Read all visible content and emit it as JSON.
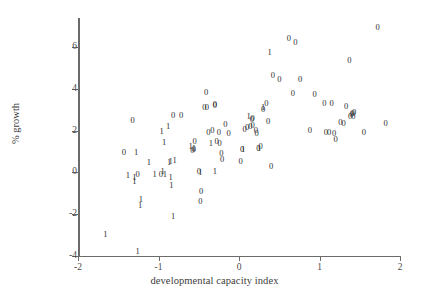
{
  "chart_data": {
    "type": "scatter",
    "title": "",
    "xlabel": "developmental capacity index",
    "ylabel": "% growth",
    "xlim": [
      -2,
      2
    ],
    "ylim": [
      -4,
      7.4
    ],
    "xticks": [
      "-2",
      "-1",
      "0",
      "1",
      "2"
    ],
    "xtick_values": [
      -2,
      -1,
      0,
      1,
      2
    ],
    "yticks": [
      "6",
      "4",
      "2",
      "0",
      "-2",
      "-4"
    ],
    "ytick_values": [
      6,
      4,
      2,
      0,
      -2,
      -4
    ],
    "grid": false,
    "legend": "none",
    "marker_style": "text-glyph",
    "series": [
      {
        "name": "0",
        "marker_label": "0",
        "points": [
          [
            -1.32,
            2.52
          ],
          [
            -1.43,
            0.95
          ],
          [
            -1.26,
            -0.07
          ],
          [
            -0.97,
            -0.1
          ],
          [
            -0.82,
            2.73
          ],
          [
            -0.72,
            2.73
          ],
          [
            -0.58,
            1.05
          ],
          [
            -0.56,
            1.12
          ],
          [
            -0.55,
            1.48
          ],
          [
            -0.5,
            0.05
          ],
          [
            -0.47,
            -0.88
          ],
          [
            -0.48,
            -1.38
          ],
          [
            -0.41,
            3.85
          ],
          [
            -0.43,
            3.12
          ],
          [
            -0.4,
            3.12
          ],
          [
            -0.38,
            1.92
          ],
          [
            -0.33,
            2.02
          ],
          [
            -0.3,
            3.22
          ],
          [
            -0.3,
            3.28
          ],
          [
            -0.28,
            1.52
          ],
          [
            -0.25,
            1.92
          ],
          [
            -0.24,
            1.42
          ],
          [
            -0.22,
            0.92
          ],
          [
            -0.21,
            0.62
          ],
          [
            -0.17,
            2.32
          ],
          [
            -0.13,
            1.88
          ],
          [
            0.02,
            0.55
          ],
          [
            0.04,
            1.12
          ],
          [
            0.07,
            2.08
          ],
          [
            0.1,
            2.18
          ],
          [
            0.14,
            2.22
          ],
          [
            0.16,
            2.55
          ],
          [
            0.17,
            2.58
          ],
          [
            0.17,
            2.28
          ],
          [
            0.21,
            2.02
          ],
          [
            0.22,
            1.88
          ],
          [
            0.24,
            1.18
          ],
          [
            0.27,
            1.28
          ],
          [
            0.3,
            3.02
          ],
          [
            0.34,
            3.32
          ],
          [
            0.36,
            2.48
          ],
          [
            0.4,
            0.32
          ],
          [
            0.42,
            4.68
          ],
          [
            0.5,
            4.48
          ],
          [
            0.62,
            6.45
          ],
          [
            0.67,
            3.78
          ],
          [
            0.7,
            6.25
          ],
          [
            0.76,
            4.48
          ],
          [
            0.88,
            2.02
          ],
          [
            0.94,
            3.75
          ],
          [
            1.06,
            3.32
          ],
          [
            1.08,
            1.95
          ],
          [
            1.12,
            1.92
          ],
          [
            1.15,
            3.32
          ],
          [
            1.18,
            1.9
          ],
          [
            1.2,
            1.58
          ],
          [
            1.26,
            2.42
          ],
          [
            1.3,
            2.38
          ],
          [
            1.33,
            3.18
          ],
          [
            1.38,
            2.72
          ],
          [
            1.4,
            2.78
          ],
          [
            1.41,
            2.82
          ],
          [
            1.42,
            2.7
          ],
          [
            1.43,
            2.88
          ],
          [
            1.37,
            5.38
          ],
          [
            1.55,
            1.92
          ],
          [
            1.72,
            6.98
          ],
          [
            1.82,
            2.38
          ]
        ]
      },
      {
        "name": "1",
        "marker_label": "1",
        "points": [
          [
            -1.66,
            -2.98
          ],
          [
            -1.38,
            -0.12
          ],
          [
            -1.3,
            -0.25
          ],
          [
            -1.3,
            -0.42
          ],
          [
            -1.28,
            0.95
          ],
          [
            -1.26,
            -3.78
          ],
          [
            -1.22,
            -1.28
          ],
          [
            -1.23,
            -1.58
          ],
          [
            -1.12,
            0.48
          ],
          [
            -1.05,
            -0.1
          ],
          [
            -0.96,
            1.98
          ],
          [
            -0.95,
            0.08
          ],
          [
            -0.93,
            1.45
          ],
          [
            -0.92,
            -0.08
          ],
          [
            -0.88,
            2.22
          ],
          [
            -0.87,
            0.48
          ],
          [
            -0.85,
            0.55
          ],
          [
            -0.85,
            -0.22
          ],
          [
            -0.84,
            -0.62
          ],
          [
            -0.82,
            -2.12
          ],
          [
            -0.8,
            0.58
          ],
          [
            -0.6,
            1.28
          ],
          [
            -0.56,
            1.18
          ],
          [
            -0.48,
            0.02
          ],
          [
            -0.35,
            1.42
          ],
          [
            -0.3,
            0.05
          ],
          [
            0.05,
            1.12
          ],
          [
            0.12,
            2.72
          ],
          [
            0.25,
            1.18
          ],
          [
            0.3,
            3.12
          ],
          [
            0.38,
            5.78
          ]
        ]
      }
    ]
  }
}
